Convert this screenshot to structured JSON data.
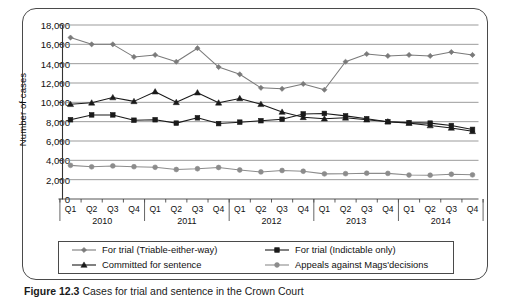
{
  "figure": {
    "caption_prefix": "Figure 12.3",
    "caption_text": "Cases for trial and sentence in the Crown Court"
  },
  "chart_data": {
    "type": "line",
    "title": "",
    "xlabel": "",
    "ylabel": "Number of cases",
    "ylim": [
      0,
      18000
    ],
    "ytick_step": 2000,
    "ytick_labels": [
      "0",
      "2,000",
      "4,000",
      "6,000",
      "8,000",
      "10,000",
      "12,000",
      "14,000",
      "16,000",
      "18,000"
    ],
    "ytick_values": [
      0,
      2000,
      4000,
      6000,
      8000,
      10000,
      12000,
      14000,
      16000,
      18000
    ],
    "grid": true,
    "legend_position": "bottom",
    "quarters": [
      "Q1",
      "Q2",
      "Q3",
      "Q4",
      "Q1",
      "Q2",
      "Q3",
      "Q4",
      "Q1",
      "Q2",
      "Q3",
      "Q4",
      "Q1",
      "Q2",
      "Q3",
      "Q4",
      "Q1",
      "Q2",
      "Q3",
      "Q4"
    ],
    "years": [
      "2010",
      "2011",
      "2012",
      "2013",
      "2014"
    ],
    "categories": [
      "2010 Q1",
      "2010 Q2",
      "2010 Q3",
      "2010 Q4",
      "2011 Q1",
      "2011 Q2",
      "2011 Q3",
      "2011 Q4",
      "2012 Q1",
      "2012 Q2",
      "2012 Q3",
      "2012 Q4",
      "2013 Q1",
      "2013 Q2",
      "2013 Q3",
      "2013 Q4",
      "2014 Q1",
      "2014 Q2",
      "2014 Q3",
      "2014 Q4"
    ],
    "series": [
      {
        "name": "For trial (Triable-either-way)",
        "marker": "diamond",
        "color": "#7a7a7a",
        "values": [
          16700,
          16000,
          16000,
          14700,
          14900,
          14200,
          15600,
          13650,
          12900,
          11500,
          11400,
          11900,
          11300,
          14200,
          15000,
          14800,
          14900,
          14800,
          15200,
          14900
        ]
      },
      {
        "name": "For trial (Indictable only)",
        "marker": "square",
        "color": "#1a1a1a",
        "values": [
          8200,
          8700,
          8700,
          8150,
          8200,
          7850,
          8400,
          7800,
          7950,
          8100,
          8250,
          8800,
          8850,
          8600,
          8300,
          8000,
          7900,
          7850,
          7600,
          7200
        ]
      },
      {
        "name": "Committed for sentence",
        "marker": "triangle",
        "color": "#1a1a1a",
        "values": [
          9800,
          9950,
          10500,
          10100,
          11100,
          10000,
          11000,
          9950,
          10400,
          9800,
          9000,
          8450,
          8300,
          8400,
          8200,
          8000,
          7850,
          7600,
          7350,
          7000
        ]
      },
      {
        "name": "Appeals against Mags'decisions",
        "marker": "circle",
        "color": "#8c8c8c",
        "values": [
          3480,
          3330,
          3420,
          3340,
          3280,
          3050,
          3130,
          3260,
          3000,
          2800,
          2950,
          2870,
          2600,
          2620,
          2670,
          2650,
          2480,
          2460,
          2560,
          2500
        ]
      }
    ]
  }
}
